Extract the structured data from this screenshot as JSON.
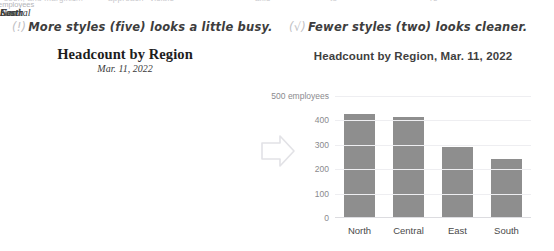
{
  "ghost_row": {
    "fragments": [
      "seen, and margin .... ",
      "is",
      "approach",
      "visible",
      "axis",
      "to",
      "re"
    ]
  },
  "panels": [
    {
      "annotation_mark": "(!)",
      "annotation_text": "More styles (five) looks a little busy.",
      "title": "Headcount by Region",
      "subtitle": "Mar. 11, 2022",
      "unit_label": "employees"
    },
    {
      "annotation_mark": "(√)",
      "annotation_text": "Fewer styles (two) looks cleaner.",
      "title": "Headcount by Region, Mar. 11, 2022",
      "unit_label": "500 employees"
    }
  ],
  "arrow": {
    "name": "right-arrow"
  },
  "chart_data": [
    {
      "type": "bar",
      "title": "Headcount by Region",
      "subtitle": "Mar. 11, 2022",
      "categories": [
        "North",
        "Central",
        "East",
        "South"
      ],
      "values": [
        425,
        412,
        290,
        243
      ],
      "xlabel": "",
      "ylabel": "employees",
      "ylim": [
        0,
        500
      ],
      "yticks": [
        500,
        400,
        300,
        200,
        100,
        0
      ],
      "grid": true,
      "legend": "none",
      "bar_color": "#8e8e8e"
    },
    {
      "type": "bar",
      "title": "Headcount by Region, Mar. 11, 2022",
      "categories": [
        "North",
        "Central",
        "East",
        "South"
      ],
      "values": [
        425,
        412,
        290,
        243
      ],
      "xlabel": "",
      "ylabel": "employees",
      "ylim": [
        0,
        500
      ],
      "yticks": [
        500,
        400,
        300,
        200,
        100,
        0
      ],
      "grid": true,
      "legend": "none",
      "bar_color": "#8e8e8e"
    }
  ]
}
